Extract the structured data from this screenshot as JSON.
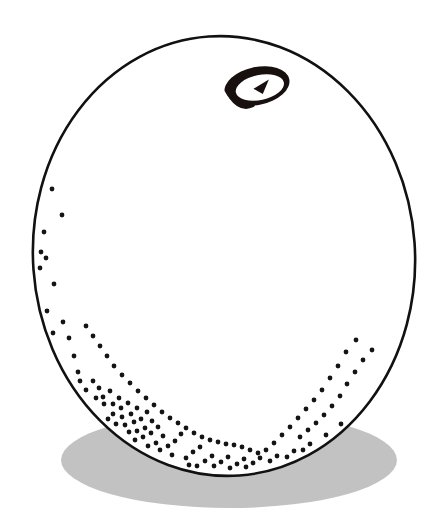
{
  "figure": {
    "title": "Sphere with settled particles and rotation marker",
    "canvas": {
      "width": 441,
      "height": 532,
      "background": "#ffffff"
    },
    "colors": {
      "outline": "#111111",
      "fill": "#ffffff",
      "shadow": "#c2c2c2",
      "particle": "#141414",
      "marker": "#17100f"
    },
    "shapes": {
      "ground_shadow": {
        "name": "ground-shadow",
        "type": "ellipse",
        "cx": 229,
        "cy": 460,
        "rx": 168,
        "ry": 48,
        "fill": "#c2c2c2"
      },
      "balloon": {
        "name": "balloon-body",
        "type": "ellipse",
        "cx": 224,
        "cy": 256,
        "rx": 191,
        "ry": 220,
        "rotation_deg": -4,
        "stroke": "#111111",
        "stroke_width": 2.6,
        "fill": "#ffffff"
      },
      "rotation_marker": {
        "name": "rotation-arrow-marker",
        "type": "spiral-arrow",
        "cx": 257,
        "cy": 86,
        "rx": 33,
        "ry": 19,
        "rotation_deg": -12,
        "stroke": "#17100f",
        "arrow_direction": "counter-clockwise"
      }
    },
    "particles": {
      "name": "particle-cloud",
      "count": 172,
      "radius_px": 2.4,
      "color": "#141414",
      "description": "Dots densest along the lower rim of the sphere, thinning upward along both sides",
      "points": [
        [
          52,
          189
        ],
        [
          62,
          215
        ],
        [
          44,
          232
        ],
        [
          41,
          252
        ],
        [
          46,
          258
        ],
        [
          40,
          268
        ],
        [
          54,
          284
        ],
        [
          47,
          311
        ],
        [
          63,
          322
        ],
        [
          53,
          333
        ],
        [
          69,
          338
        ],
        [
          57,
          347
        ],
        [
          60,
          358
        ],
        [
          74,
          356
        ],
        [
          66,
          369
        ],
        [
          78,
          372
        ],
        [
          63,
          381
        ],
        [
          72,
          385
        ],
        [
          80,
          381
        ],
        [
          86,
          390
        ],
        [
          93,
          381
        ],
        [
          99,
          388
        ],
        [
          88,
          399
        ],
        [
          96,
          398
        ],
        [
          103,
          397
        ],
        [
          110,
          391
        ],
        [
          104,
          404
        ],
        [
          113,
          404
        ],
        [
          119,
          398
        ],
        [
          121,
          408
        ],
        [
          128,
          403
        ],
        [
          113,
          414
        ],
        [
          122,
          417
        ],
        [
          131,
          414
        ],
        [
          137,
          408
        ],
        [
          101,
          413
        ],
        [
          94,
          410
        ],
        [
          108,
          419
        ],
        [
          116,
          424
        ],
        [
          125,
          425
        ],
        [
          134,
          422
        ],
        [
          141,
          419
        ],
        [
          147,
          412
        ],
        [
          152,
          421
        ],
        [
          145,
          428
        ],
        [
          137,
          431
        ],
        [
          129,
          432
        ],
        [
          120,
          433
        ],
        [
          112,
          430
        ],
        [
          126,
          441
        ],
        [
          135,
          440
        ],
        [
          143,
          437
        ],
        [
          151,
          433
        ],
        [
          158,
          427
        ],
        [
          163,
          436
        ],
        [
          156,
          443
        ],
        [
          148,
          446
        ],
        [
          140,
          447
        ],
        [
          133,
          449
        ],
        [
          152,
          454
        ],
        [
          160,
          450
        ],
        [
          168,
          446
        ],
        [
          175,
          441
        ],
        [
          181,
          434
        ],
        [
          172,
          455
        ],
        [
          164,
          458
        ],
        [
          177,
          462
        ],
        [
          186,
          458
        ],
        [
          193,
          452
        ],
        [
          200,
          447
        ],
        [
          189,
          465
        ],
        [
          197,
          466
        ],
        [
          205,
          461
        ],
        [
          212,
          456
        ],
        [
          206,
          469
        ],
        [
          214,
          466
        ],
        [
          221,
          462
        ],
        [
          228,
          457
        ],
        [
          222,
          470
        ],
        [
          230,
          468
        ],
        [
          237,
          464
        ],
        [
          244,
          459
        ],
        [
          238,
          470
        ],
        [
          246,
          467
        ],
        [
          253,
          463
        ],
        [
          260,
          458
        ],
        [
          255,
          469
        ],
        [
          263,
          466
        ],
        [
          270,
          461
        ],
        [
          277,
          456
        ],
        [
          272,
          466
        ],
        [
          280,
          462
        ],
        [
          287,
          457
        ],
        [
          294,
          451
        ],
        [
          289,
          461
        ],
        [
          296,
          456
        ],
        [
          303,
          450
        ],
        [
          310,
          444
        ],
        [
          305,
          454
        ],
        [
          312,
          448
        ],
        [
          319,
          442
        ],
        [
          326,
          435
        ],
        [
          321,
          446
        ],
        [
          328,
          439
        ],
        [
          335,
          432
        ],
        [
          341,
          424
        ],
        [
          337,
          437
        ],
        [
          344,
          429
        ],
        [
          350,
          421
        ],
        [
          355,
          412
        ],
        [
          352,
          427
        ],
        [
          358,
          418
        ],
        [
          364,
          409
        ],
        [
          369,
          399
        ],
        [
          366,
          414
        ],
        [
          371,
          404
        ],
        [
          376,
          394
        ],
        [
          380,
          383
        ],
        [
          378,
          400
        ],
        [
          383,
          389
        ],
        [
          387,
          377
        ],
        [
          390,
          365
        ],
        [
          388,
          385
        ],
        [
          392,
          372
        ],
        [
          395,
          359
        ],
        [
          397,
          346
        ],
        [
          396,
          364
        ],
        [
          399,
          350
        ],
        [
          401,
          336
        ],
        [
          402,
          321
        ],
        [
          404,
          338
        ],
        [
          406,
          323
        ],
        [
          407,
          307
        ],
        [
          408,
          291
        ],
        [
          372,
          350
        ],
        [
          363,
          360
        ],
        [
          355,
          372
        ],
        [
          347,
          384
        ],
        [
          340,
          396
        ],
        [
          332,
          406
        ],
        [
          324,
          415
        ],
        [
          316,
          423
        ],
        [
          308,
          430
        ],
        [
          300,
          437
        ],
        [
          356,
          340
        ],
        [
          346,
          352
        ],
        [
          338,
          366
        ],
        [
          330,
          378
        ],
        [
          322,
          390
        ],
        [
          314,
          400
        ],
        [
          306,
          409
        ],
        [
          298,
          418
        ],
        [
          290,
          427
        ],
        [
          282,
          435
        ],
        [
          274,
          443
        ],
        [
          266,
          450
        ],
        [
          258,
          453
        ],
        [
          250,
          450
        ],
        [
          242,
          447
        ],
        [
          234,
          445
        ],
        [
          226,
          444
        ],
        [
          218,
          442
        ],
        [
          210,
          440
        ],
        [
          202,
          437
        ],
        [
          194,
          433
        ],
        [
          186,
          428
        ],
        [
          178,
          423
        ],
        [
          170,
          418
        ],
        [
          162,
          412
        ],
        [
          154,
          405
        ],
        [
          146,
          398
        ],
        [
          138,
          391
        ],
        [
          130,
          383
        ],
        [
          122,
          375
        ],
        [
          114,
          366
        ],
        [
          107,
          356
        ],
        [
          100,
          346
        ],
        [
          93,
          336
        ],
        [
          86,
          326
        ]
      ]
    }
  },
  "labels": {
    "none_visible": ""
  }
}
